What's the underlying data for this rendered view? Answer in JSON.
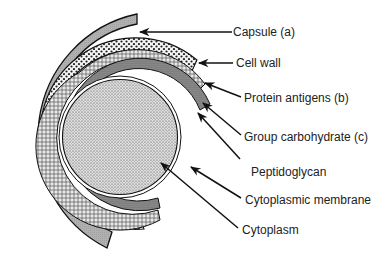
{
  "figure": {
    "type": "cross-section diagram",
    "labels": [
      {
        "id": "capsule",
        "text": "Capsule (a)",
        "x": 233,
        "y": 25
      },
      {
        "id": "cell-wall",
        "text": "Cell wall",
        "x": 236,
        "y": 56
      },
      {
        "id": "protein-antigens",
        "text": "Protein antigens (b)",
        "x": 244,
        "y": 91
      },
      {
        "id": "group-carbohydrate",
        "text": "Group carbohydrate (c)",
        "x": 244,
        "y": 130
      },
      {
        "id": "peptidoglycan",
        "text": "Peptidoglycan",
        "x": 251,
        "y": 165
      },
      {
        "id": "cytoplasmic-membrane",
        "text": "Cytoplasmic membrane",
        "x": 245,
        "y": 193
      },
      {
        "id": "cytoplasm",
        "text": "Cytoplasm",
        "x": 242,
        "y": 223
      }
    ],
    "layers_outer_to_inner": [
      "Capsule (a)",
      "Protein antigens (b)",
      "Group carbohydrate (c)",
      "Peptidoglycan",
      "Cytoplasmic membrane",
      "Cytoplasm"
    ],
    "colors": {
      "capsule_fill": "#a9a9a9",
      "outline": "#111111",
      "background": "#ffffff",
      "text": "#222222"
    }
  }
}
